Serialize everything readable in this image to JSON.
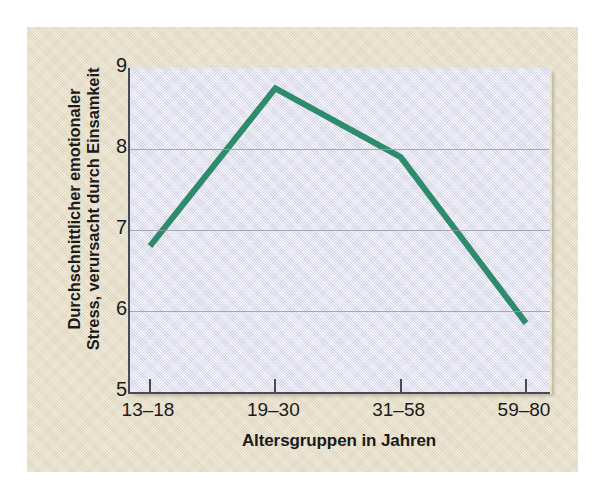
{
  "figure": {
    "background_color": "#e3dabf",
    "page_color": "#ffffff"
  },
  "chart_data": {
    "type": "line",
    "title": "",
    "xlabel": "Altersgruppen in Jahren",
    "ylabel_line1": "Durchschnittlicher emotionaler",
    "ylabel_line2": "Stress, verursacht durch Einsamkeit",
    "categories": [
      "13–18",
      "19–30",
      "31–58",
      "59–80"
    ],
    "values": [
      6.8,
      8.75,
      7.9,
      5.85
    ],
    "series": [
      {
        "name": "Durchschnittlicher emotionaler Stress",
        "values": [
          6.8,
          8.75,
          7.9,
          5.85
        ],
        "color": "#2e8b6b",
        "line_width": 6
      }
    ],
    "ylim": [
      5,
      9
    ],
    "yticks": [
      5,
      6,
      7,
      8,
      9
    ],
    "ytick_labels": [
      "5",
      "6",
      "7",
      "8",
      "9"
    ],
    "gridlines_y": [
      6,
      7,
      8
    ],
    "grid": true,
    "grid_color": "#9a9ab0",
    "legend": "none",
    "plot_background_color": "#dddded",
    "axis_color": "#4a4a55"
  }
}
